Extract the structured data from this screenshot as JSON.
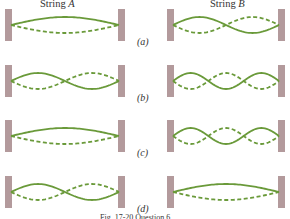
{
  "figure": {
    "columns": [
      {
        "name": "String",
        "letter": "A"
      },
      {
        "name": "String",
        "letter": "B"
      }
    ],
    "rows": [
      {
        "label": "(a)",
        "string_a_loops": 1,
        "string_b_loops": 2
      },
      {
        "label": "(b)",
        "string_a_loops": 2,
        "string_b_loops": 3
      },
      {
        "label": "(c)",
        "string_a_loops": 1,
        "string_b_loops": 3
      },
      {
        "label": "(d)",
        "string_a_loops": 2,
        "string_b_loops": 1
      }
    ],
    "colors": {
      "string": "#6a9a3a",
      "wall": "#b39a9c"
    },
    "caption": "Fig. 17-20 Question 6."
  }
}
